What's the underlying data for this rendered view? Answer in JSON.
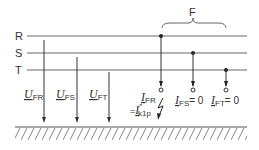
{
  "diagram": {
    "phases": [
      {
        "id": "R",
        "label": "R"
      },
      {
        "id": "S",
        "label": "S"
      },
      {
        "id": "T",
        "label": "T"
      }
    ],
    "fault_label": "F",
    "voltages": [
      {
        "symbol": "U",
        "subscript": "FR"
      },
      {
        "symbol": "U",
        "subscript": "FS"
      },
      {
        "symbol": "U",
        "subscript": "FT"
      }
    ],
    "currents": {
      "i_fr": {
        "symbol": "I",
        "subscript": "FR"
      },
      "i_k1p": {
        "prefix": "=",
        "symbol": "I",
        "superscript": "″",
        "subscript": "k1p"
      },
      "i_fs": {
        "symbol": "I",
        "subscript": "FS",
        "value": "= 0"
      },
      "i_ft": {
        "symbol": "I",
        "subscript": "FT",
        "value": "= 0"
      }
    },
    "colors": {
      "line": "#555555",
      "text": "#333333"
    }
  }
}
